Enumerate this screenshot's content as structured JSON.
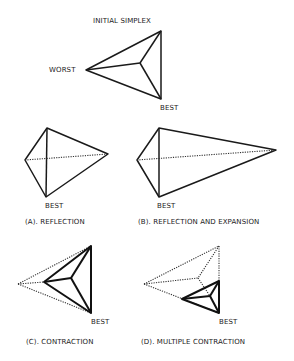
{
  "diagram": {
    "panels": [
      {
        "id": "initial",
        "caption": "INITIAL SIMPLEX",
        "labels": {
          "worst": "WORST",
          "best": "BEST"
        }
      },
      {
        "id": "a",
        "caption": "(A). REFLECTION",
        "labels": {
          "best": "BEST"
        }
      },
      {
        "id": "b",
        "caption": "(B). REFLECTION AND EXPANSION",
        "labels": {
          "best": "BEST"
        }
      },
      {
        "id": "c",
        "caption": "(C). CONTRACTION",
        "labels": {
          "best": "BEST"
        }
      },
      {
        "id": "d",
        "caption": "(D). MULTIPLE CONTRACTION",
        "labels": {
          "best": "BEST"
        }
      }
    ],
    "colors": {
      "line": "#1a1a1a",
      "background": "#ffffff"
    }
  }
}
